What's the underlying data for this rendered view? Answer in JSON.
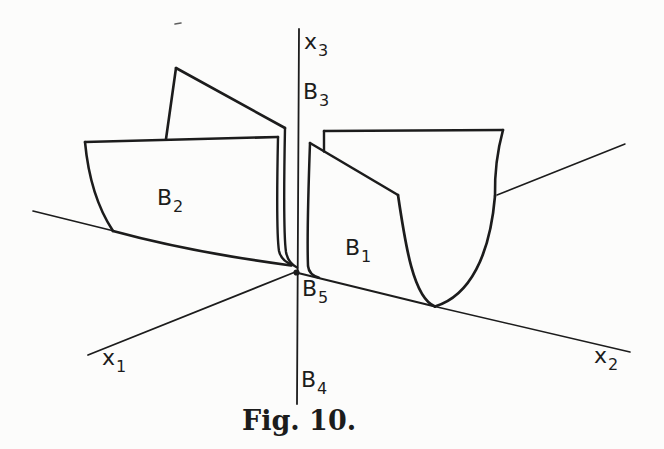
{
  "colors": {
    "ink": "#1c1c1c",
    "paper": "#fcfcfb"
  },
  "labels": {
    "x3": {
      "main": "x",
      "sub": "3"
    },
    "b3": {
      "main": "B",
      "sub": "3"
    },
    "b2": {
      "main": "B",
      "sub": "2"
    },
    "b1": {
      "main": "B",
      "sub": "1"
    },
    "b5": {
      "main": "B",
      "sub": "5"
    },
    "b4": {
      "main": "B",
      "sub": "4"
    },
    "x1": {
      "main": "x",
      "sub": "1"
    },
    "x2": {
      "main": "x",
      "sub": "2"
    }
  },
  "caption": "Fig. 10."
}
